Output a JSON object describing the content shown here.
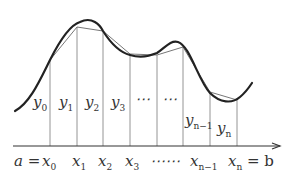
{
  "diagram": {
    "colors": {
      "curve": "#222222",
      "chord": "#777777",
      "ordinate": "#888888",
      "axis": "#333333",
      "text": "#333333"
    },
    "axis": {
      "y": 146,
      "x_start": 13,
      "x_end": 280
    },
    "ordinates": [
      {
        "x": 50,
        "top": 60
      },
      {
        "x": 77,
        "top": 27
      },
      {
        "x": 103,
        "top": 31
      },
      {
        "x": 130,
        "top": 54
      },
      {
        "x": 157,
        "top": 55
      },
      {
        "x": 183,
        "top": 47
      },
      {
        "x": 210,
        "top": 92
      },
      {
        "x": 237,
        "top": 100
      }
    ],
    "curve_path": "M15,111 C30,103 40,80 50,60 C60,40 70,25 80,22 C92,16 100,25 103,31 C110,42 118,52 130,55 C140,58 150,56 157,53 C165,48 170,40 178,42 C190,46 198,80 210,93 C220,103 232,104 240,97 C246,92 250,86 252,83",
    "y_labels": [
      {
        "base": "y",
        "sub": "0",
        "x": 33,
        "y": 107
      },
      {
        "base": "y",
        "sub": "1",
        "x": 59,
        "y": 107
      },
      {
        "base": "y",
        "sub": "2",
        "x": 85,
        "y": 107
      },
      {
        "base": "y",
        "sub": "3",
        "x": 111,
        "y": 107
      },
      {
        "base": "⋯",
        "sub": "",
        "x": 135,
        "y": 104
      },
      {
        "base": "⋯",
        "sub": "",
        "x": 162,
        "y": 104
      },
      {
        "base": "y",
        "sub": "n−1",
        "x": 185,
        "y": 125
      },
      {
        "base": "y",
        "sub": "n",
        "x": 217,
        "y": 133
      }
    ],
    "x_labels": [
      {
        "text": "a",
        "sub": "",
        "x": 14,
        "suffix": " ="
      },
      {
        "text": "x",
        "sub": "0",
        "x": 42,
        "suffix": ""
      },
      {
        "text": "x",
        "sub": "1",
        "x": 72,
        "suffix": ""
      },
      {
        "text": "x",
        "sub": "2",
        "x": 98,
        "suffix": ""
      },
      {
        "text": "x",
        "sub": "3",
        "x": 125,
        "suffix": ""
      },
      {
        "text": "⋯⋯",
        "sub": "",
        "x": 150,
        "suffix": ""
      },
      {
        "text": "x",
        "sub": "n−1",
        "x": 190,
        "suffix": ""
      },
      {
        "text": "x",
        "sub": "n",
        "x": 228,
        "suffix": " = b"
      }
    ]
  }
}
